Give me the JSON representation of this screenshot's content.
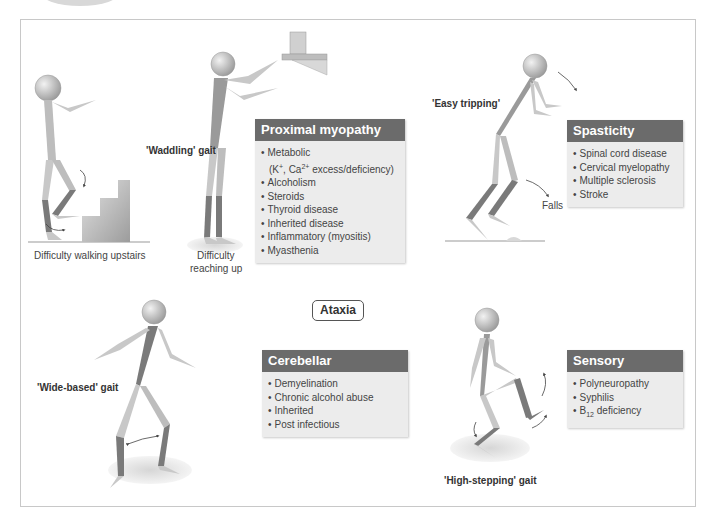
{
  "sections": {
    "proximal_myopathy": {
      "title": "Proximal myopathy",
      "items": [
        "Metabolic",
        "(K+, Ca2+ excess/deficiency)",
        "Alcoholism",
        "Steroids",
        "Thyroid disease",
        "Inherited disease",
        "Inflammatory (myositis)",
        "Myasthenia"
      ]
    },
    "spasticity": {
      "title": "Spasticity",
      "items": [
        "Spinal cord disease",
        "Cervical myelopathy",
        "Multiple sclerosis",
        "Stroke"
      ]
    },
    "cerebellar": {
      "title": "Cerebellar",
      "items": [
        "Demyelination",
        "Chronic alcohol abuse",
        "Inherited",
        "Post infectious"
      ]
    },
    "sensory": {
      "title": "Sensory",
      "items": [
        "Polyneuropathy",
        "Syphilis",
        "B12 deficiency"
      ]
    }
  },
  "labels": {
    "waddling": "'Waddling' gait",
    "upstairs": "Difficulty walking upstairs",
    "reaching_1": "Difficulty",
    "reaching_2": "reaching up",
    "easy_tripping": "'Easy tripping'",
    "falls": "Falls",
    "ataxia": "Ataxia",
    "wide_based": "'Wide-based' gait",
    "high_stepping": "'High-stepping' gait"
  },
  "colors": {
    "header": "#6b6b6b",
    "box_bg": "#ececec",
    "figure_light": "#c8c8c8",
    "figure_dark": "#7a7a7a",
    "frame": "#c8c8c8"
  }
}
